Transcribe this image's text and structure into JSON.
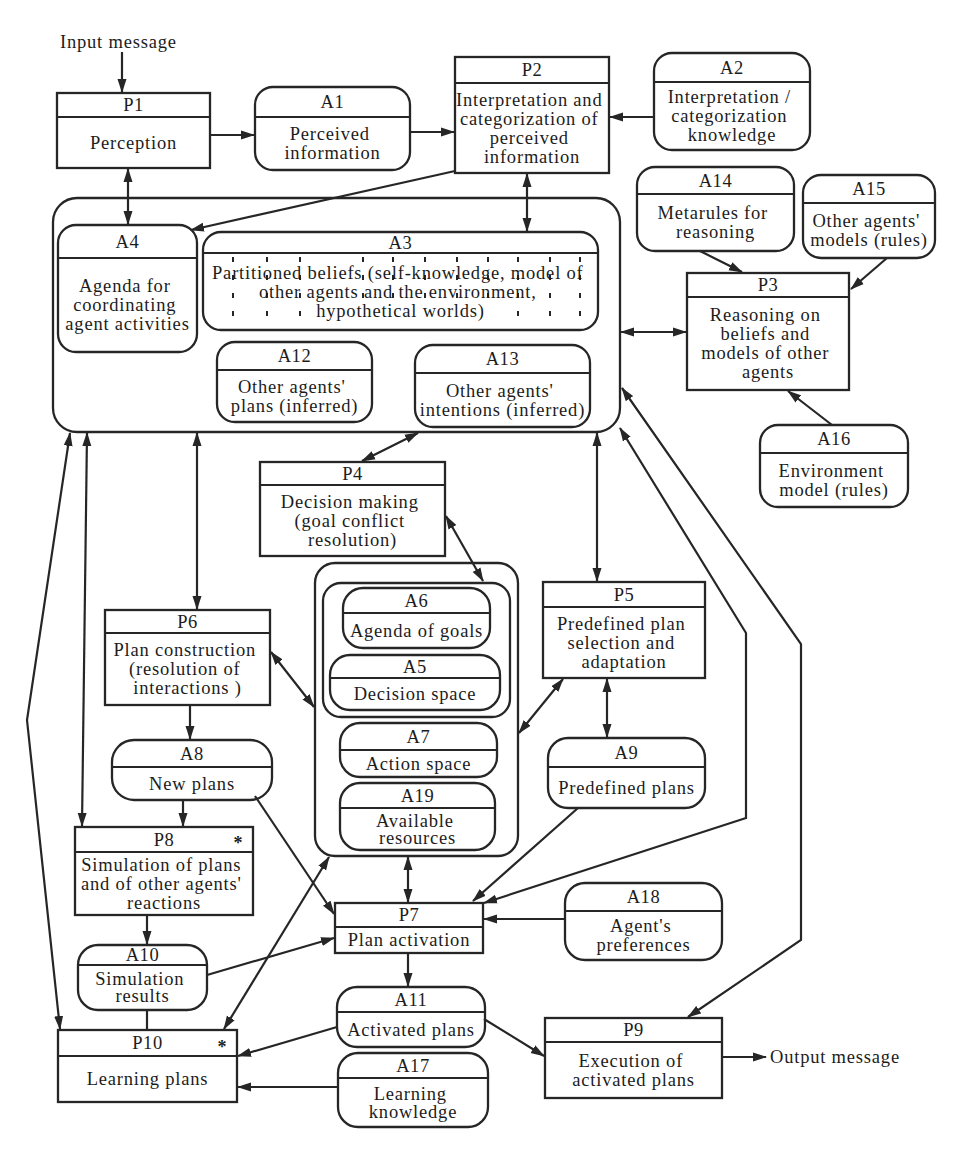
{
  "diagram": {
    "input_message": "Input message",
    "output_message": "Output message",
    "processes": {
      "P1": {
        "id": "P1",
        "lines": [
          "Perception"
        ]
      },
      "P2": {
        "id": "P2",
        "lines": [
          "Interpretation and",
          "categorization of",
          "perceived",
          "information"
        ]
      },
      "P3": {
        "id": "P3",
        "lines": [
          "Reasoning on",
          "beliefs and",
          "models of other",
          "agents"
        ]
      },
      "P4": {
        "id": "P4",
        "lines": [
          "Decision making",
          "(goal conflict",
          "resolution)"
        ]
      },
      "P5": {
        "id": "P5",
        "lines": [
          "Predefined plan",
          "selection  and",
          "adaptation"
        ]
      },
      "P6": {
        "id": "P6",
        "lines": [
          "Plan construction",
          "(resolution of",
          "interactions )"
        ]
      },
      "P7": {
        "id": "P7",
        "lines": [
          "Plan activation"
        ]
      },
      "P8": {
        "id": "P8",
        "marker": "*",
        "lines": [
          "Simulation of plans",
          "and of other agents'",
          "reactions"
        ]
      },
      "P9": {
        "id": "P9",
        "lines": [
          "Execution of",
          "activated plans"
        ]
      },
      "P10": {
        "id": "P10",
        "marker": "*",
        "lines": [
          "Learning plans"
        ]
      }
    },
    "knowledge": {
      "A1": {
        "id": "A1",
        "lines": [
          "Perceived",
          "information"
        ]
      },
      "A2": {
        "id": "A2",
        "lines": [
          "Interpretation /",
          "categorization",
          "knowledge"
        ]
      },
      "A3": {
        "id": "A3",
        "lines": [
          "Partitioned beliefs (self-knowledge, model of",
          "other agents and the environment,",
          "hypothetical worlds)"
        ]
      },
      "A4": {
        "id": "A4",
        "lines": [
          "Agenda for",
          "coordinating",
          "agent activities"
        ]
      },
      "A5": {
        "id": "A5",
        "lines": [
          "Decision space"
        ]
      },
      "A6": {
        "id": "A6",
        "lines": [
          "Agenda of goals"
        ]
      },
      "A7": {
        "id": "A7",
        "lines": [
          "Action space"
        ]
      },
      "A8": {
        "id": "A8",
        "lines": [
          "New plans"
        ]
      },
      "A9": {
        "id": "A9",
        "lines": [
          "Predefined plans"
        ]
      },
      "A10": {
        "id": "A10",
        "lines": [
          "Simulation",
          "results"
        ]
      },
      "A11": {
        "id": "A11",
        "lines": [
          "Activated plans"
        ]
      },
      "A12": {
        "id": "A12",
        "lines": [
          "Other agents'",
          "plans (inferred)"
        ]
      },
      "A13": {
        "id": "A13",
        "lines": [
          "Other agents'",
          "intentions (inferred)"
        ]
      },
      "A14": {
        "id": "A14",
        "lines": [
          "Metarules for",
          "reasoning"
        ]
      },
      "A15": {
        "id": "A15",
        "lines": [
          "Other agents'",
          "models (rules)"
        ]
      },
      "A16": {
        "id": "A16",
        "lines": [
          "Environment",
          "model (rules)"
        ]
      },
      "A17": {
        "id": "A17",
        "lines": [
          "Learning",
          "knowledge"
        ]
      },
      "A18": {
        "id": "A18",
        "lines": [
          "Agent's",
          "preferences"
        ]
      },
      "A19": {
        "id": "A19",
        "lines": [
          "Available",
          "resources"
        ]
      }
    },
    "colors": {
      "ink": "#262626",
      "background": "#ffffff"
    }
  }
}
